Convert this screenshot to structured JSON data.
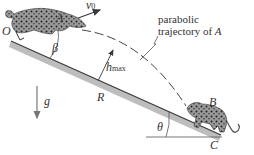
{
  "figure": {
    "type": "projectile-on-incline diagram",
    "labels": {
      "origin": "O",
      "point_a": "A",
      "point_b": "B",
      "point_c": "C",
      "velocity": "v",
      "velocity_sub": "0",
      "beta": "β",
      "theta": "θ",
      "gravity": "g",
      "range": "R",
      "hmax": "h",
      "hmax_sub": "max",
      "trajectory_line1": "parabolic",
      "trajectory_line2": "trajectory of ",
      "trajectory_var": "A"
    },
    "colors": {
      "line": "#3a3a3a",
      "slope_band": "#b8b8b8",
      "text": "#333333",
      "cat_body": "#8a8a8a",
      "cat_spots": "#2a2a2a"
    }
  }
}
